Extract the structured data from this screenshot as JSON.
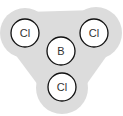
{
  "diagram": {
    "title": "",
    "molecule": "BCl3",
    "cloud_color": "#dcdcdc",
    "atom_fill": "#ffffff",
    "atom_stroke": "#111111",
    "atoms": [
      {
        "id": "cl-top-left",
        "label": "Cl",
        "cx": 25,
        "cy": 33
      },
      {
        "id": "cl-top-right",
        "label": "Cl",
        "cx": 93,
        "cy": 33
      },
      {
        "id": "b-center",
        "label": "B",
        "cx": 61,
        "cy": 51
      },
      {
        "id": "cl-bottom",
        "label": "Cl",
        "cx": 62,
        "cy": 87
      }
    ]
  }
}
